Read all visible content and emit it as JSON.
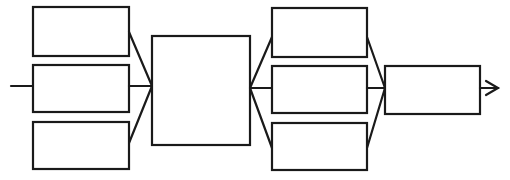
{
  "diagram": {
    "type": "block-flow",
    "colors": {
      "stroke": "#1a1a1a",
      "background": "#ffffff"
    },
    "input": {
      "label": ""
    },
    "stage1": {
      "boxes": [
        {
          "label": ""
        },
        {
          "label": ""
        },
        {
          "label": ""
        }
      ]
    },
    "stage2": {
      "box": {
        "label": ""
      }
    },
    "stage3": {
      "boxes": [
        {
          "label": ""
        },
        {
          "label": ""
        },
        {
          "label": ""
        }
      ]
    },
    "stage4": {
      "box": {
        "label": ""
      }
    },
    "output": {
      "label": ""
    }
  }
}
